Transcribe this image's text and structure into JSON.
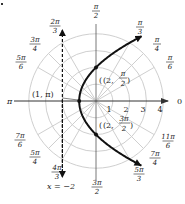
{
  "diagram": {
    "type": "polar-graph",
    "center_px": [
      96,
      101
    ],
    "unit_px": 16.8,
    "rings": [
      1,
      2,
      3,
      4
    ],
    "radial_ticks": [
      "1",
      "2",
      "3",
      "4"
    ],
    "angle_labels": [
      {
        "num": "π",
        "den": "2",
        "angle_deg": 90
      },
      {
        "num": "π",
        "den": "3",
        "angle_deg": 60
      },
      {
        "num": "π",
        "den": "4",
        "angle_deg": 45
      },
      {
        "num": "π",
        "den": "6",
        "angle_deg": 30
      },
      {
        "num": "0",
        "den": "",
        "angle_deg": 0
      },
      {
        "num": "11π",
        "den": "6",
        "angle_deg": 330
      },
      {
        "num": "7π",
        "den": "4",
        "angle_deg": 315
      },
      {
        "num": "5π",
        "den": "3",
        "angle_deg": 300
      },
      {
        "num": "3π",
        "den": "2",
        "angle_deg": 270
      },
      {
        "num": "4π",
        "den": "3",
        "angle_deg": 240
      },
      {
        "num": "5π",
        "den": "4",
        "angle_deg": 225
      },
      {
        "num": "7π",
        "den": "6",
        "angle_deg": 210
      },
      {
        "num": "π",
        "den": "",
        "angle_deg": 180
      },
      {
        "num": "5π",
        "den": "6",
        "angle_deg": 150
      },
      {
        "num": "3π",
        "den": "4",
        "angle_deg": 135
      },
      {
        "num": "2π",
        "den": "3",
        "angle_deg": 120
      }
    ],
    "points": [
      {
        "label": "(1, π)",
        "r": 1,
        "theta": "π"
      },
      {
        "label_prefix": "(2, ",
        "num": "π",
        "den": "2",
        "r": 2,
        "theta": "π/2"
      },
      {
        "label_prefix": "(2, ",
        "num": "3π",
        "den": "2",
        "r": 2,
        "theta": "3π/2"
      }
    ],
    "directrix_label": "x = −2",
    "colors": {
      "grid": "#c8c8c8",
      "axis": "#333333",
      "curve": "#111111",
      "text": "#222222"
    }
  }
}
